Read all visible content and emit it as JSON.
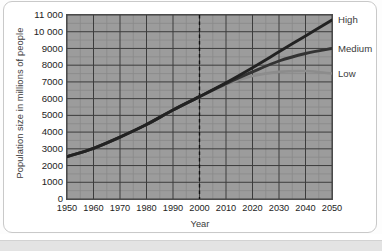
{
  "chart_data": {
    "type": "line",
    "title": "",
    "xlabel": "Year",
    "ylabel": "Population size in millions of people",
    "xlim": [
      1950,
      2050
    ],
    "ylim": [
      0,
      11000
    ],
    "ytick_step": 1000,
    "xtick_step": 10,
    "grid": true,
    "minor_grid": true,
    "legend_position": "right-of-plot",
    "annotations": [
      {
        "type": "vertical-dashed-line",
        "x": 2000,
        "label": ""
      }
    ],
    "ytick_labels": [
      "0",
      "1000",
      "2000",
      "3000",
      "4000",
      "5000",
      "6000",
      "7000",
      "8000",
      "9000",
      "10 000",
      "11 000"
    ],
    "ytick_values": [
      0,
      1000,
      2000,
      3000,
      4000,
      5000,
      6000,
      7000,
      8000,
      9000,
      10000,
      11000
    ],
    "xtick_labels": [
      "1950",
      "1960",
      "1970",
      "1980",
      "1990",
      "2000",
      "2010",
      "2020",
      "2030",
      "2040",
      "2050"
    ],
    "xtick_values": [
      1950,
      1960,
      1970,
      1980,
      1990,
      2000,
      2010,
      2020,
      2030,
      2040,
      2050
    ],
    "x": [
      1950,
      1960,
      1970,
      1980,
      1990,
      2000,
      2010,
      2020,
      2030,
      2040,
      2050
    ],
    "series": [
      {
        "name": "High",
        "color": "#222222",
        "values": [
          2530,
          3030,
          3700,
          4450,
          5320,
          6120,
          6950,
          7850,
          8800,
          9750,
          10700
        ]
      },
      {
        "name": "Medium",
        "color": "#333333",
        "values": [
          2530,
          3030,
          3700,
          4450,
          5320,
          6120,
          6900,
          7600,
          8250,
          8700,
          9000
        ]
      },
      {
        "name": "Low",
        "color": "#8c8c8c",
        "values": [
          2530,
          3030,
          3700,
          4450,
          5320,
          6120,
          6850,
          7350,
          7600,
          7650,
          7500
        ]
      }
    ],
    "legend": [
      {
        "label": "High",
        "color": "#222222"
      },
      {
        "label": "Medium",
        "color": "#333333"
      },
      {
        "label": "Low",
        "color": "#8c8c8c"
      }
    ]
  },
  "colors": {
    "plot_background": "#9c9c9c",
    "grid_major": "#3c3c3c",
    "grid_minor": "#8a8a8a",
    "axis": "#3a3a3a",
    "card_background": "#ffffff",
    "card_border": "#c9c9c9",
    "footer_strip": "#e3e3e3"
  }
}
